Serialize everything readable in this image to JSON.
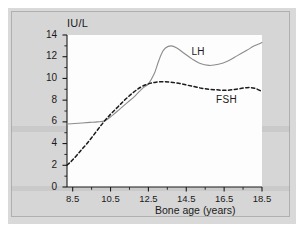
{
  "figure": {
    "background_color": "#d6d6d6",
    "plot_background_color": "#fdfdfd",
    "line_color": "#8c8c8c",
    "text_color": "#1a1a1a"
  },
  "chart_data": {
    "type": "line",
    "title": "",
    "xlabel": "Bone age (years)",
    "ylabel": "IU/L",
    "xlim": [
      8.2,
      18.5
    ],
    "ylim": [
      0,
      14
    ],
    "grid": false,
    "legend_position": "inline-annotation",
    "xticks": [
      8.5,
      10.5,
      12.5,
      14.5,
      16.5,
      18.5
    ],
    "xtick_labels": [
      "8.5",
      "10.5",
      "12.5",
      "14.5",
      "16.5",
      "18.5"
    ],
    "xminor_step": 1.0,
    "yticks": [
      0,
      2,
      4,
      6,
      8,
      10,
      12,
      14
    ],
    "ytick_labels": [
      "0",
      "2",
      "4",
      "6",
      "8",
      "10",
      "12",
      "14"
    ],
    "yminor_step": 1.0,
    "annotations": [
      {
        "text": "LH",
        "x": 15.25,
        "y": 12.3
      },
      {
        "text": "FSH",
        "x": 16.55,
        "y": 7.95
      }
    ],
    "series": [
      {
        "name": "LH",
        "style": "solid",
        "color": "#8c8c8c",
        "x": [
          8.2,
          8.6,
          9.0,
          9.4,
          9.8,
          10.2,
          10.6,
          11.0,
          11.4,
          11.8,
          12.2,
          12.5,
          12.8,
          13.0,
          13.2,
          13.4,
          13.7,
          14.0,
          14.4,
          14.8,
          15.2,
          15.7,
          16.2,
          16.7,
          17.2,
          17.7,
          18.1,
          18.5
        ],
        "y": [
          5.8,
          5.85,
          5.9,
          5.95,
          6.0,
          6.1,
          6.6,
          7.2,
          7.8,
          8.4,
          9.1,
          9.5,
          10.4,
          11.4,
          12.3,
          12.8,
          13.0,
          12.8,
          12.3,
          11.8,
          11.4,
          11.2,
          11.3,
          11.6,
          12.1,
          12.6,
          13.0,
          13.3
        ]
      },
      {
        "name": "FSH",
        "style": "dashed",
        "color": "#1a1a1a",
        "x": [
          8.2,
          8.5,
          8.9,
          9.3,
          9.7,
          10.1,
          10.5,
          10.9,
          11.3,
          11.7,
          12.1,
          12.5,
          12.9,
          13.3,
          13.7,
          14.1,
          14.5,
          14.9,
          15.3,
          15.7,
          16.1,
          16.5,
          16.9,
          17.3,
          17.7,
          18.1,
          18.5
        ],
        "y": [
          2.0,
          2.5,
          3.3,
          4.1,
          5.0,
          5.9,
          6.7,
          7.4,
          8.1,
          8.7,
          9.2,
          9.5,
          9.65,
          9.7,
          9.65,
          9.55,
          9.4,
          9.25,
          9.1,
          9.0,
          8.95,
          8.9,
          8.95,
          9.05,
          9.15,
          9.1,
          8.8
        ]
      }
    ]
  }
}
